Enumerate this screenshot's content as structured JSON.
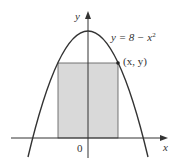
{
  "figure": {
    "y_axis_label": "y",
    "x_axis_label": "x",
    "origin_label": "0",
    "curve_label_prefix": "y = 8 − x",
    "curve_label_exponent": "2",
    "point_label": "(x, y)",
    "colors": {
      "rectangle_fill": "#d9d9d9",
      "stroke": "#333333",
      "background": "#ffffff"
    }
  }
}
